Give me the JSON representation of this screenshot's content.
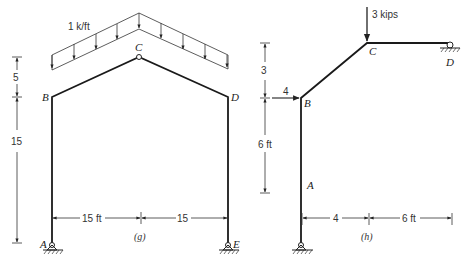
{
  "figure_g": {
    "caption": "(g)",
    "load_label": "1 k/ft",
    "joints": {
      "A": "A",
      "B": "B",
      "C": "C",
      "D": "D",
      "E": "E"
    },
    "dims": {
      "rise": "5",
      "height": "15",
      "left_span": "15 ft",
      "right_span": "15"
    }
  },
  "figure_h": {
    "caption": "(h)",
    "vertical_load": "3 kips",
    "horizontal_load": "4",
    "joints": {
      "A": "A",
      "B": "B",
      "C": "C",
      "D": "D"
    },
    "dims": {
      "upper_height": "3",
      "lower_height": "6 ft",
      "left_span": "4",
      "right_span": "6 ft"
    }
  },
  "colors": {
    "line": "#1a1a1a",
    "background": "#ffffff"
  }
}
